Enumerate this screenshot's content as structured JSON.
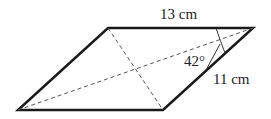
{
  "figure": {
    "shape": "parallelogram",
    "labels": {
      "top_side": "13 cm",
      "right_side": "11 cm",
      "angle": "42°"
    },
    "diagonals": "dashed",
    "colors": {
      "stroke": "#1a1a1a",
      "dash": "#555555",
      "text": "#222222"
    }
  }
}
